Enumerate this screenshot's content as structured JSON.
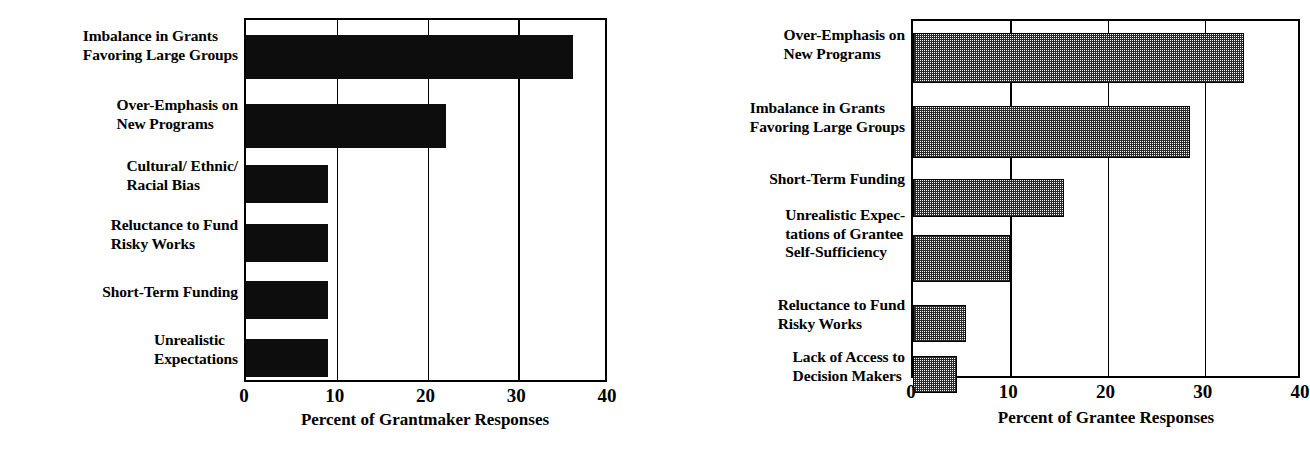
{
  "chart_data": [
    {
      "type": "bar",
      "orientation": "horizontal",
      "panel": "left",
      "title": "",
      "xlabel": "Percent of Grantmaker Responses",
      "ylabel": "",
      "xlim": [
        0,
        40
      ],
      "xticks": [
        0,
        10,
        20,
        30,
        40
      ],
      "xtick_labels": [
        "0",
        "10",
        "20",
        "30",
        "40"
      ],
      "grid": true,
      "grid_axis": "x",
      "bar_style": "solid-black",
      "categories": [
        "Imbalance in Grants\nFavoring Large Groups",
        "Over-Emphasis on\nNew Programs",
        "Cultural/ Ethnic/\nRacial Bias",
        "Reluctance to Fund\nRisky Works",
        "Short-Term Funding",
        "Unrealistic\nExpectations"
      ],
      "values": [
        36,
        22,
        9,
        9,
        9,
        9
      ]
    },
    {
      "type": "bar",
      "orientation": "horizontal",
      "panel": "right",
      "title": "",
      "xlabel": "Percent of Grantee Responses",
      "ylabel": "",
      "xlim": [
        0,
        40
      ],
      "xticks": [
        0,
        10,
        20,
        30,
        40
      ],
      "xtick_labels": [
        "0",
        "10",
        "20",
        "30",
        "40"
      ],
      "grid": true,
      "grid_axis": "x",
      "bar_style": "checkered-hatch",
      "categories": [
        "Over-Emphasis on\nNew Programs",
        "Imbalance in Grants\nFavoring Large Groups",
        "Short-Term Funding",
        "Unrealistic Expec-\ntations of Grantee\nSelf-Sufficiency",
        "Reluctance to Fund\nRisky Works",
        "Lack of Access to\nDecision  Makers"
      ],
      "values": [
        34,
        28.5,
        15.5,
        10,
        5.5,
        4.5
      ]
    }
  ],
  "left_panel": {
    "axis_title": "Percent of Grantmaker Responses",
    "ticks": [
      "0",
      "10",
      "20",
      "30",
      "40"
    ],
    "categories": [
      "Imbalance in Grants\nFavoring Large Groups",
      "Over-Emphasis on\nNew Programs",
      "Cultural/ Ethnic/\nRacial Bias",
      "Reluctance to Fund\nRisky Works",
      "Short-Term Funding",
      "Unrealistic\nExpectations"
    ]
  },
  "right_panel": {
    "axis_title": "Percent of Grantee Responses",
    "ticks": [
      "0",
      "10",
      "20",
      "30",
      "40"
    ],
    "categories": [
      "Over-Emphasis on\nNew Programs",
      "Imbalance in Grants\nFavoring Large Groups",
      "Short-Term Funding",
      "Unrealistic Expec-\ntations of Grantee\nSelf-Sufficiency",
      "Reluctance to Fund\nRisky Works",
      "Lack of Access to\nDecision  Makers"
    ]
  }
}
